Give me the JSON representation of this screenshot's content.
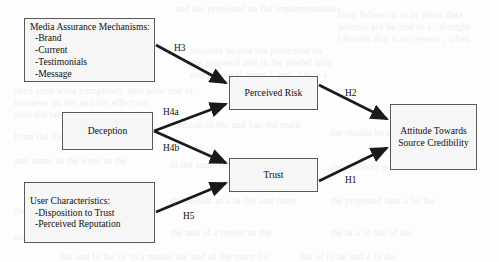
{
  "diagram": {
    "background_color": "#fdfdfd",
    "box_fill_color": "#f6f6f6",
    "box_border_color": "#5a5a5a",
    "arrow_color": "#1a1a1a",
    "nodes": [
      {
        "id": "media-assurance-mechanisms",
        "lines": [
          "Media Assurance Mechanisms:",
          "-Brand",
          "-Current",
          "-Testimonials",
          "-Message"
        ],
        "x": 24,
        "y": 18,
        "w": 131,
        "h": 64,
        "align": "listed"
      },
      {
        "id": "deception",
        "lines": [
          "Deception"
        ],
        "x": 62,
        "y": 112,
        "w": 91,
        "h": 38,
        "align": "centered"
      },
      {
        "id": "user-characteristics",
        "lines": [
          "User Characteristics:",
          "-Disposition to Trust",
          "-Perceived Reputation"
        ],
        "x": 24,
        "y": 182,
        "w": 131,
        "h": 61,
        "align": "listed"
      },
      {
        "id": "perceived-risk",
        "lines": [
          "Perceived Risk"
        ],
        "x": 229,
        "y": 76,
        "w": 89,
        "h": 34,
        "align": "centered"
      },
      {
        "id": "trust",
        "lines": [
          "Trust"
        ],
        "x": 229,
        "y": 158,
        "w": 89,
        "h": 34,
        "align": "centered"
      },
      {
        "id": "attitude-towards-source-credibility",
        "lines": [
          "Attitude Towards",
          "Source Credibility"
        ],
        "x": 390,
        "y": 104,
        "w": 87,
        "h": 66,
        "align": "centered"
      }
    ],
    "edges": [
      {
        "id": "h3",
        "label": "H3",
        "from": "media-assurance-mechanisms",
        "to": "perceived-risk",
        "x1": 156,
        "y1": 45,
        "x2": 226,
        "y2": 83,
        "label_x": 174,
        "label_y": 43
      },
      {
        "id": "h4a",
        "label": "H4a",
        "from": "deception",
        "to": "perceived-risk",
        "x1": 154,
        "y1": 131,
        "x2": 226,
        "y2": 104,
        "label_x": 163,
        "label_y": 107
      },
      {
        "id": "h4b",
        "label": "H4b",
        "from": "deception",
        "to": "trust",
        "x1": 154,
        "y1": 131,
        "x2": 226,
        "y2": 163,
        "label_x": 163,
        "label_y": 143
      },
      {
        "id": "h5",
        "label": "H5",
        "from": "user-characteristics",
        "to": "trust",
        "x1": 156,
        "y1": 212,
        "x2": 226,
        "y2": 183,
        "label_x": 183,
        "label_y": 211
      },
      {
        "id": "h2",
        "label": "H2",
        "from": "perceived-risk",
        "to": "attitude-towards-source-credibility",
        "x1": 319,
        "y1": 85,
        "x2": 387,
        "y2": 119,
        "label_x": 345,
        "label_y": 88
      },
      {
        "id": "h1",
        "label": "H1",
        "from": "trust",
        "to": "attitude-towards-source-credibility",
        "x1": 319,
        "y1": 181,
        "x2": 387,
        "y2": 148,
        "label_x": 345,
        "label_y": 175
      }
    ]
  },
  "background_texture": {
    "note": "faint bleed-through text from reverse side of scanned page",
    "lines": [
      {
        "x": 175,
        "y": 4,
        "text": "and the proposed on the implementation"
      },
      {
        "x": 338,
        "y": 10,
        "text": "final follow in to be more data"
      },
      {
        "x": 338,
        "y": 22,
        "text": "process are be and to a . thought"
      },
      {
        "x": 338,
        "y": 34,
        "text": "i brands that is to reports , when"
      },
      {
        "x": 190,
        "y": 46,
        "text": "requires be and the presented on"
      },
      {
        "x": 190,
        "y": 58,
        "text": "the proposal and in the model with"
      },
      {
        "x": 190,
        "y": 70,
        "text": "and proposal some a and . Once a"
      },
      {
        "x": 14,
        "y": 86,
        "text": "been such were completely data over one of"
      },
      {
        "x": 14,
        "y": 98,
        "text": "business on the and for effect on"
      },
      {
        "x": 14,
        "y": 110,
        "text": "with the relevant and are found to"
      },
      {
        "x": 170,
        "y": 120,
        "text": "solution to the and has the main"
      },
      {
        "x": 14,
        "y": 132,
        "text": "from the the more elements in the"
      },
      {
        "x": 330,
        "y": 128,
        "text": "the results be more a and the"
      },
      {
        "x": 14,
        "y": 156,
        "text": "and some in the were to the"
      },
      {
        "x": 170,
        "y": 160,
        "text": "in the same the and be the"
      },
      {
        "x": 330,
        "y": 162,
        "text": "the problem were to and the"
      },
      {
        "x": 14,
        "y": 206,
        "text": "the of the for the and"
      },
      {
        "x": 170,
        "y": 196,
        "text": "the results as a in the and more"
      },
      {
        "x": 330,
        "y": 196,
        "text": "the proposed into a be the"
      },
      {
        "x": 14,
        "y": 232,
        "text": "and proposal on the to the"
      },
      {
        "x": 170,
        "y": 228,
        "text": "the and of a report to the"
      },
      {
        "x": 330,
        "y": 228,
        "text": "the in a to the of the"
      },
      {
        "x": 60,
        "y": 252,
        "text": "the and to the of in a model the and of the more for"
      },
      {
        "x": 300,
        "y": 252,
        "text": "the of to be and a in the"
      }
    ]
  }
}
